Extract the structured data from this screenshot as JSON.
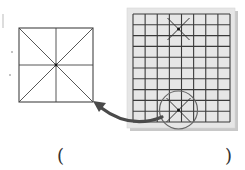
{
  "figure": {
    "colors": {
      "line": "#444444",
      "board_bg": "#e6e6e6",
      "board_shadow": "#c8c8c8",
      "arrow": "#4a4a4a",
      "circle": "#666666"
    },
    "square": {
      "x": 19,
      "y": 28,
      "size": 74,
      "pattern": "mi-zi-ge"
    },
    "board": {
      "panel": {
        "x": 127,
        "y": 8,
        "width": 108,
        "height": 120
      },
      "grid": {
        "x": 133,
        "y": 14,
        "width": 97,
        "height": 108,
        "columns": 8,
        "rows": 10
      },
      "top_cross": {
        "cx": 178.5,
        "cy": 29,
        "half": 11
      },
      "bottom_cross": {
        "cx": 178.5,
        "cy": 110,
        "half": 12
      },
      "highlight_circle": {
        "cx": 178.5,
        "cy": 110,
        "r": 19
      }
    },
    "arrow": {
      "from": "board bottom circle",
      "to": "left square bottom-right corner"
    }
  },
  "answer_blank": {
    "left_paren": "(",
    "right_paren": ")"
  }
}
